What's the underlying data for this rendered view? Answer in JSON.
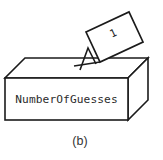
{
  "figure": {
    "caption": "(b)",
    "box": {
      "label": "NumberOfGuesses",
      "stroke_color": "#1b1b1b",
      "fill_color": "#ffffff",
      "label_color": "#2b2b2b"
    },
    "card": {
      "value": "1",
      "stroke_color": "#1b1b1b",
      "fill_color": "#ffffff",
      "value_color": "#2b2b2b"
    },
    "slot": {
      "name": "insertion-slot"
    },
    "background_color": "#ffffff",
    "caption_color": "#333333"
  }
}
